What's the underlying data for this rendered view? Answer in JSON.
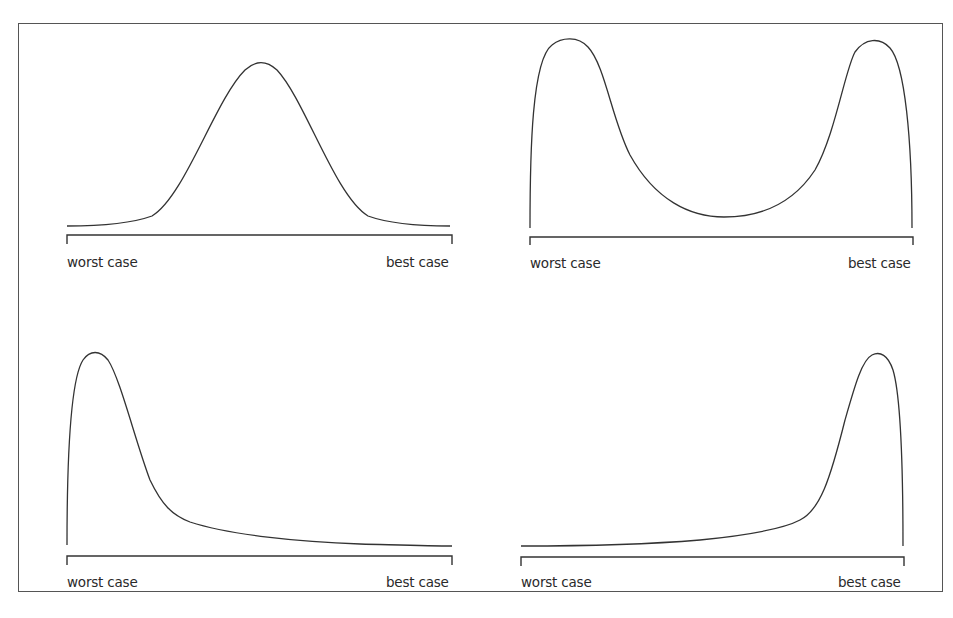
{
  "figure": {
    "colors": {
      "line": "#333333",
      "frame": "#555555",
      "background": "#ffffff"
    }
  },
  "panels": [
    {
      "id": "top-left",
      "shape": "symmetric bell (normal)",
      "axis_labels": {
        "left": "worst case",
        "right": "best case"
      }
    },
    {
      "id": "top-right",
      "shape": "bimodal U-shaped",
      "axis_labels": {
        "left": "worst case",
        "right": "best case"
      }
    },
    {
      "id": "bottom-left",
      "shape": "right-skewed, peak near worst case",
      "axis_labels": {
        "left": "worst case",
        "right": "best case"
      }
    },
    {
      "id": "bottom-right",
      "shape": "left-skewed, peak near best case",
      "axis_labels": {
        "left": "worst case",
        "right": "best case"
      }
    }
  ]
}
